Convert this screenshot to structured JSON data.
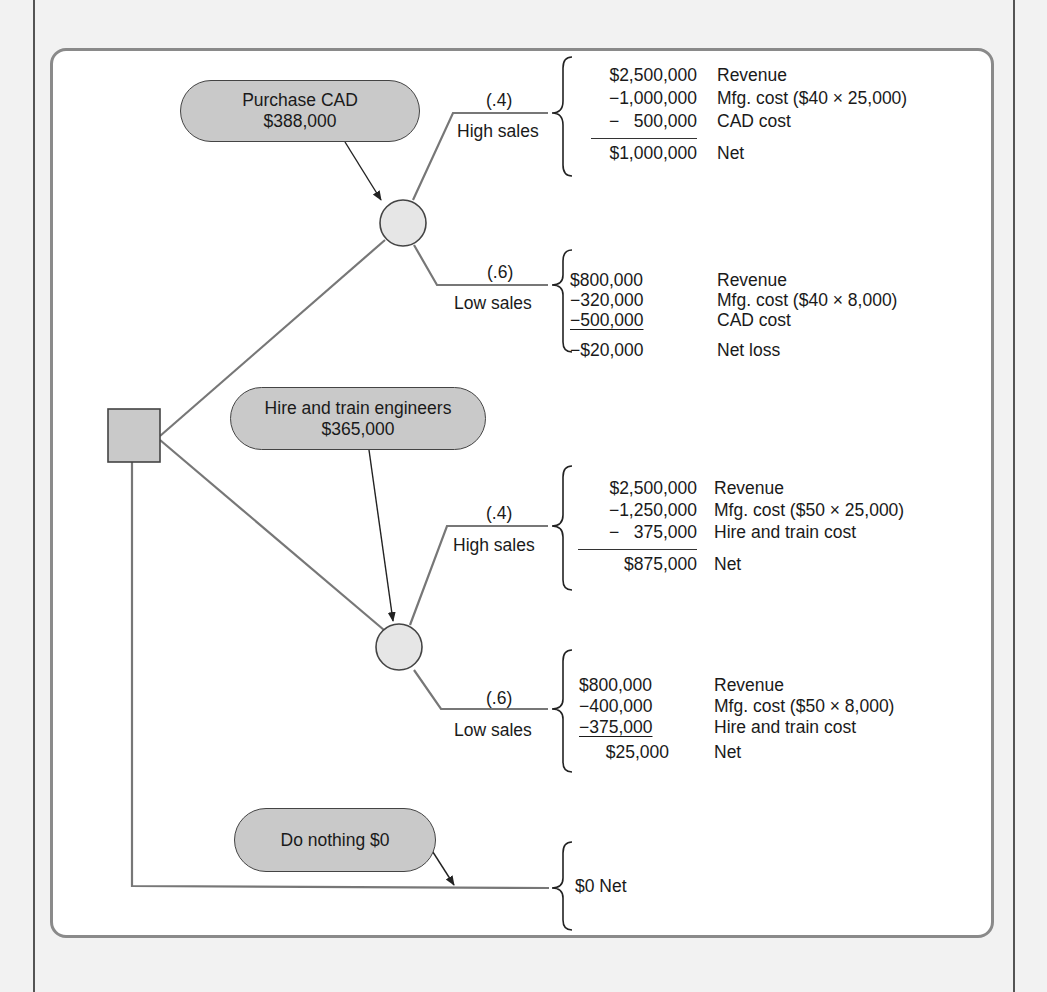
{
  "decisions": {
    "purchase_cad": {
      "title": "Purchase CAD",
      "value": "$388,000"
    },
    "hire_train": {
      "title": "Hire and train engineers",
      "value": "$365,000"
    },
    "do_nothing": {
      "title": "Do nothing $0"
    }
  },
  "branches": {
    "cad_high": {
      "prob": "(.4)",
      "label": "High sales",
      "rows": [
        {
          "amount": "$2,500,000",
          "desc": "Revenue"
        },
        {
          "amount": "−1,000,000",
          "desc": "Mfg. cost ($40 × 25,000)"
        },
        {
          "amount": "−   500,000",
          "desc": "CAD cost"
        },
        {
          "amount": "$1,000,000",
          "desc": "Net"
        }
      ]
    },
    "cad_low": {
      "prob": "(.6)",
      "label": "Low sales",
      "rows": [
        {
          "amount": "$800,000",
          "desc": "Revenue"
        },
        {
          "amount": "−320,000",
          "desc": "Mfg. cost ($40 × 8,000)"
        },
        {
          "amount": "−500,000",
          "desc": "CAD cost"
        },
        {
          "amount": "−$20,000",
          "desc": "Net loss"
        }
      ]
    },
    "hire_high": {
      "prob": "(.4)",
      "label": "High sales",
      "rows": [
        {
          "amount": "$2,500,000",
          "desc": "Revenue"
        },
        {
          "amount": "−1,250,000",
          "desc": "Mfg. cost ($50 × 25,000)"
        },
        {
          "amount": "−   375,000",
          "desc": "Hire and train cost"
        },
        {
          "amount": "$875,000",
          "desc": "Net"
        }
      ]
    },
    "hire_low": {
      "prob": "(.6)",
      "label": "Low sales",
      "rows": [
        {
          "amount": "$800,000",
          "desc": "Revenue"
        },
        {
          "amount": "−400,000",
          "desc": "Mfg. cost ($50 × 8,000)"
        },
        {
          "amount": "−375,000",
          "desc": "Hire and train cost"
        },
        {
          "amount": "$25,000",
          "desc": "Net"
        }
      ]
    },
    "nothing": {
      "result": "$0 Net"
    }
  },
  "colors": {
    "node_fill": "#c9c9c9",
    "circle_fill": "#e6e6e6",
    "branch_line": "#777777",
    "panel_border": "#8a8a8a",
    "background": "#f2f2f2"
  }
}
